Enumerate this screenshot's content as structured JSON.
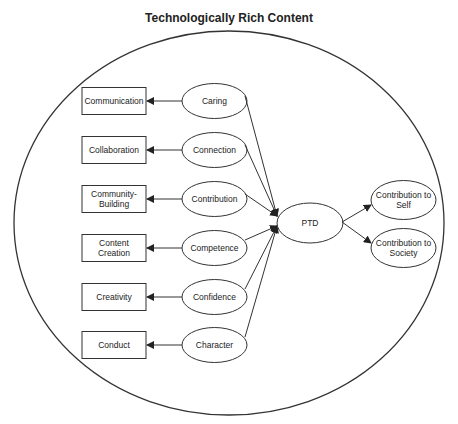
{
  "title": "Technologically Rich Content",
  "outcomes": [
    {
      "label": [
        "Communication"
      ]
    },
    {
      "label": [
        "Collaboration"
      ]
    },
    {
      "label": [
        "Community-",
        "Building"
      ]
    },
    {
      "label": [
        "Content",
        "Creation"
      ]
    },
    {
      "label": [
        "Creativity"
      ]
    },
    {
      "label": [
        "Conduct"
      ]
    }
  ],
  "cs": [
    {
      "label": "Caring"
    },
    {
      "label": "Connection"
    },
    {
      "label": "Contribution"
    },
    {
      "label": "Competence"
    },
    {
      "label": "Confidence"
    },
    {
      "label": "Character"
    }
  ],
  "center": {
    "label": "PTD"
  },
  "contributions": [
    {
      "label": [
        "Contribution to",
        "Self"
      ]
    },
    {
      "label": [
        "Contribution to",
        "Society"
      ]
    }
  ],
  "colors": {
    "stroke": "#333333",
    "text": "#222222"
  }
}
